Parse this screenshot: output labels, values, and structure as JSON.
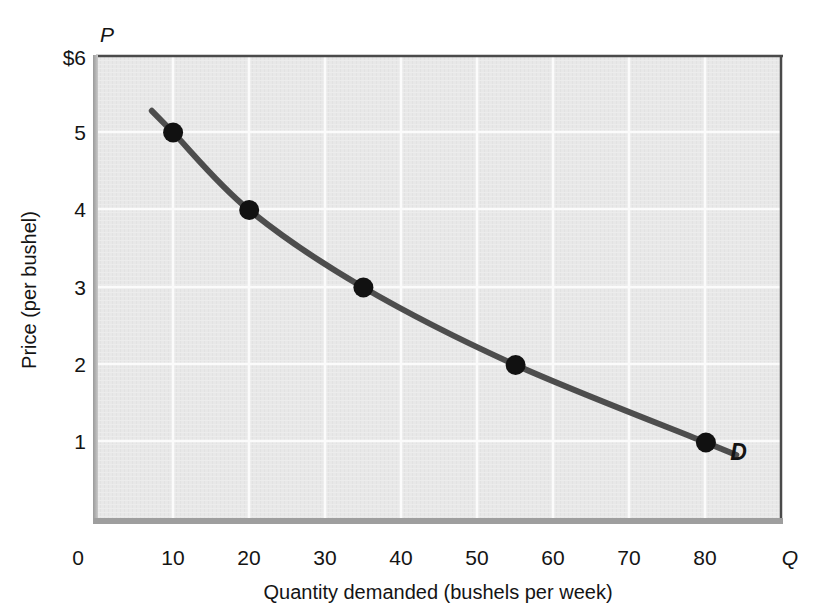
{
  "chart_data": {
    "type": "line",
    "title": "",
    "subtitle": "",
    "xlabel": "Quantity demanded (bushels per week)",
    "ylabel": "Price (per bushel)",
    "x_axis_variable": "Q",
    "y_axis_variable": "P",
    "xlim": [
      0,
      90
    ],
    "ylim": [
      0,
      6
    ],
    "xticks": [
      0,
      10,
      20,
      30,
      40,
      50,
      60,
      70,
      80
    ],
    "xtick_labels": [
      "0",
      "10",
      "20",
      "30",
      "40",
      "50",
      "60",
      "70",
      "80"
    ],
    "yticks": [
      1,
      2,
      3,
      4,
      5,
      6
    ],
    "ytick_labels": [
      "1",
      "2",
      "3",
      "4",
      "5",
      "$6"
    ],
    "grid": true,
    "grid_color": "#ffffff",
    "plot_background": "#e7e7e7",
    "legend_position": "none",
    "series": [
      {
        "name": "D",
        "label": "D",
        "label_position": "right-end",
        "color": "#4d4d4d",
        "line_width": 6,
        "x": [
          10,
          20,
          35,
          55,
          80
        ],
        "y": [
          5,
          4,
          3,
          2,
          1
        ],
        "marker": "circle",
        "marker_color": "#111111",
        "marker_size": 11,
        "curve_extends_beyond_first_point": true,
        "curve_extends_beyond_last_point": true
      }
    ],
    "annotations": [
      {
        "text": "D",
        "x": 84,
        "y": 0.85,
        "style": "bold-italic",
        "description": "demand curve label"
      }
    ]
  },
  "axes": {
    "y_unit_prefix": "$",
    "x_axis_variable_label": "Q",
    "y_axis_variable_label": "P"
  }
}
